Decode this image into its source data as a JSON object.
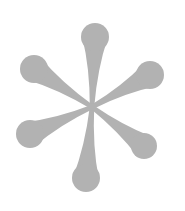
{
  "image": {
    "subject": "asterisk",
    "background_color": "#ffffff",
    "fill_color": "#b2b2b2",
    "petal_count": 6
  },
  "center": {
    "x": 92,
    "y": 107
  },
  "petals": [
    {
      "name": "top",
      "cx": 95,
      "cy": 37,
      "r": 14
    },
    {
      "name": "upper-right",
      "cx": 150,
      "cy": 75,
      "r": 14
    },
    {
      "name": "lower-right",
      "cx": 144,
      "cy": 146,
      "r": 13
    },
    {
      "name": "bottom",
      "cx": 86,
      "cy": 178,
      "r": 14
    },
    {
      "name": "lower-left",
      "cx": 30,
      "cy": 134,
      "r": 14
    },
    {
      "name": "upper-left",
      "cx": 34,
      "cy": 69,
      "r": 14
    }
  ]
}
